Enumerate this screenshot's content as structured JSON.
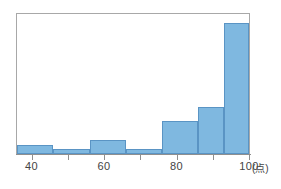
{
  "chart_data": {
    "type": "bar",
    "title": "",
    "subtitle": "",
    "xlabel": "",
    "ylabel": "",
    "unit_label": "(点)",
    "xlim": [
      36,
      100
    ],
    "ylim": [
      0,
      30
    ],
    "grid": false,
    "legend": null,
    "axis": {
      "tick_values": [
        40,
        50,
        60,
        70,
        80,
        90,
        100
      ],
      "tick_labels": [
        "40",
        "",
        "60",
        "",
        "80",
        "",
        "100"
      ],
      "visible_tick_labels": [
        "40",
        "60",
        "80",
        "100"
      ]
    },
    "bin_edges": [
      36,
      46,
      56,
      66,
      76,
      86,
      93,
      100
    ],
    "categories": [
      "36-46",
      "46-56",
      "56-66",
      "66-76",
      "76-86",
      "86-93",
      "93-100"
    ],
    "values": [
      2,
      1,
      3,
      1,
      7,
      10,
      28
    ],
    "colors": {
      "bar_fill": "#7fb8e0",
      "bar_edge": "#5a94c4",
      "frame": "#a8a8a8",
      "axis": "#8f8f8f",
      "text": "#444444",
      "background": "#ffffff"
    },
    "bars": [
      {
        "label": "36-46",
        "x_start": 36,
        "x_end": 46,
        "value": 2
      },
      {
        "label": "46-56",
        "x_start": 46,
        "x_end": 56,
        "value": 1
      },
      {
        "label": "56-66",
        "x_start": 56,
        "x_end": 66,
        "value": 3
      },
      {
        "label": "66-76",
        "x_start": 66,
        "x_end": 76,
        "value": 1
      },
      {
        "label": "76-86",
        "x_start": 76,
        "x_end": 86,
        "value": 7
      },
      {
        "label": "86-93",
        "x_start": 86,
        "x_end": 93,
        "value": 10
      },
      {
        "label": "93-100",
        "x_start": 93,
        "x_end": 100,
        "value": 28
      }
    ]
  }
}
